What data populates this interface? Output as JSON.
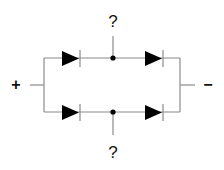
{
  "diagram": {
    "title": "",
    "terminals": {
      "positive": "+",
      "negative": "−"
    },
    "unknowns": {
      "top": "?",
      "bottom": "?"
    },
    "components": [
      {
        "id": "D1",
        "type": "diode",
        "branch": "top",
        "position": "left",
        "direction": "left-to-right"
      },
      {
        "id": "D2",
        "type": "diode",
        "branch": "top",
        "position": "right",
        "direction": "left-to-right"
      },
      {
        "id": "D3",
        "type": "diode",
        "branch": "bottom",
        "position": "left",
        "direction": "left-to-right"
      },
      {
        "id": "D4",
        "type": "diode",
        "branch": "bottom",
        "position": "right",
        "direction": "left-to-right"
      }
    ],
    "nodes": [
      {
        "id": "top-midpoint",
        "label": "?"
      },
      {
        "id": "bottom-midpoint",
        "label": "?"
      }
    ],
    "colors": {
      "wire": "#8a8a8a",
      "diode": "#000000",
      "text": "#111111",
      "background": "#ffffff"
    }
  }
}
